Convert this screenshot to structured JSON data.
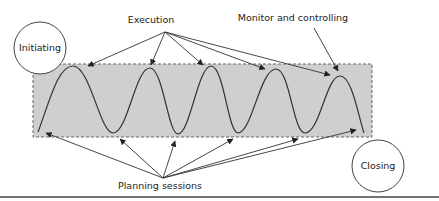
{
  "diagram": {
    "nodes": {
      "initiating": {
        "label": "Initiating"
      },
      "closing": {
        "label": "Closing"
      }
    },
    "labels": {
      "execution": "Execution",
      "monitor": "Monitor and controlling",
      "planning": "Planning sessions"
    },
    "colors": {
      "band_fill": "#cfcfcf",
      "band_border": "#666666",
      "line": "#333333",
      "background": "#ffffff"
    },
    "wave": {
      "peaks": 5,
      "troughs": 4
    }
  }
}
